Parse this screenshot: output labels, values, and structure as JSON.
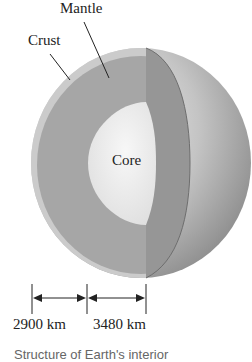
{
  "diagram": {
    "title": "Structure of Earth's interior",
    "labels": {
      "mantle": "Mantle",
      "crust": "Crust",
      "core": "Core"
    },
    "dimensions": [
      {
        "label": "2900 km",
        "represents": "mantle thickness"
      },
      {
        "label": "3480 km",
        "represents": "core radius"
      }
    ],
    "colors": {
      "crust": "#c9c9c9",
      "mantle": "#a3a3a3",
      "mantle_cut_face": "#969696",
      "core": "#ececec",
      "sphere_surface": "#b8b8b8",
      "line": "#222222"
    }
  }
}
